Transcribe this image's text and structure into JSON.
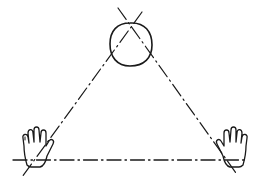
{
  "diagram": {
    "colors": {
      "ink": "#1a1a1a",
      "background": "#ffffff"
    },
    "nodes": [
      {
        "id": "head",
        "shape": "circle",
        "cx": 130,
        "cy": 45,
        "r": 21
      },
      {
        "id": "left-hand",
        "shape": "hand",
        "x": 36,
        "y": 147
      },
      {
        "id": "right-hand",
        "shape": "hand",
        "x": 225,
        "y": 147,
        "mirrored": true
      }
    ],
    "lines": [
      {
        "id": "baseline",
        "style": "dash-dot",
        "from": [
          13,
          160
        ],
        "to": [
          247,
          160
        ]
      },
      {
        "id": "left-edge",
        "style": "dash-dot",
        "from": [
          142,
          12
        ],
        "to": [
          22,
          177
        ]
      },
      {
        "id": "right-edge",
        "style": "dash-dot",
        "from": [
          118,
          8
        ],
        "to": [
          236,
          173
        ]
      }
    ],
    "labels": []
  }
}
